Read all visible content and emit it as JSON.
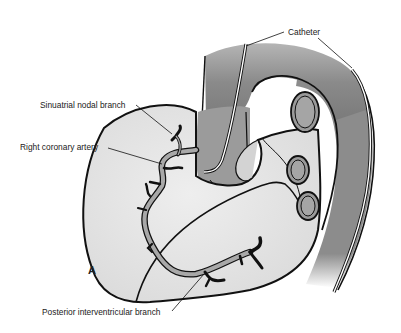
{
  "figure": {
    "panel_letter": "A",
    "labels": {
      "catheter": "Catheter",
      "sinuatrial_nodal_branch": "Sinuatrial nodal branch",
      "right_coronary_artery": "Right coronary artery",
      "posterior_interventricular_branch": "Posterior interventricular branch"
    },
    "colors": {
      "background": "#ffffff",
      "heart_fill": "#e4e4e4",
      "aorta_fill": "#8e8e8e",
      "vessel_fill": "#a8a8a8",
      "outline": "#111111",
      "catheter": "#ffffff"
    }
  }
}
